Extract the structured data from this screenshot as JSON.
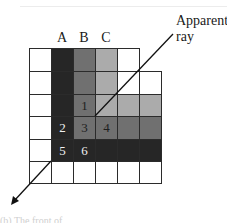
{
  "diagram": {
    "column_labels": [
      "A",
      "B",
      "C"
    ],
    "ray_label_line1": "Apparent",
    "ray_label_line2": "ray",
    "caption": "(b) The front of",
    "colors": {
      "white": "#ffffff",
      "dark": "#262626",
      "mid": "#707070",
      "light": "#ababab",
      "grid": "#2b2b2b",
      "number_on_dark": "#f0f0f0",
      "number_on_gray": "#1e1e1e"
    },
    "grid": {
      "rows": [
        [
          "white",
          "dark",
          "mid",
          "light",
          "white"
        ],
        [
          "white",
          "dark",
          "mid",
          "light",
          "white",
          "white"
        ],
        [
          "white",
          "dark",
          "mid",
          "light",
          "light",
          "light"
        ],
        [
          "white",
          "dark",
          "mid",
          "mid",
          "mid",
          "mid"
        ],
        [
          "white",
          "dark",
          "dark",
          "dark",
          "dark",
          "dark"
        ],
        [
          "white",
          "white",
          "white",
          "white",
          "white",
          "white"
        ]
      ],
      "numbers": [
        {
          "row": 2,
          "col": 2,
          "label": "1"
        },
        {
          "row": 3,
          "col": 1,
          "label": "2"
        },
        {
          "row": 3,
          "col": 2,
          "label": "3"
        },
        {
          "row": 3,
          "col": 3,
          "label": "4"
        },
        {
          "row": 4,
          "col": 1,
          "label": "5"
        },
        {
          "row": 4,
          "col": 2,
          "label": "6"
        }
      ]
    }
  }
}
